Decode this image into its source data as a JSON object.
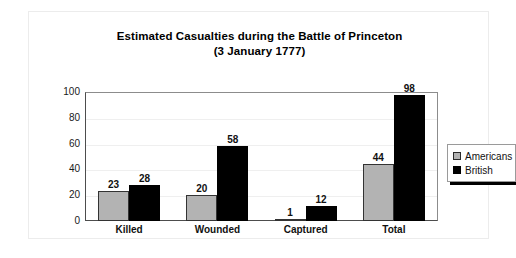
{
  "chart_data": {
    "type": "bar",
    "title": "Estimated Casualties during the Battle of Princeton",
    "subtitle": "(3 January 1777)",
    "xlabel": "",
    "ylabel": "",
    "ylim": [
      0,
      100
    ],
    "yticks": [
      0,
      20,
      40,
      60,
      80,
      100
    ],
    "grid": true,
    "legend_position": "right",
    "categories": [
      "Killed",
      "Wounded",
      "Captured",
      "Total"
    ],
    "series": [
      {
        "name": "Americans",
        "color": "#b3b3b3",
        "values": [
          23,
          20,
          1,
          44
        ]
      },
      {
        "name": "British",
        "color": "#000000",
        "values": [
          28,
          58,
          12,
          98
        ]
      }
    ]
  }
}
